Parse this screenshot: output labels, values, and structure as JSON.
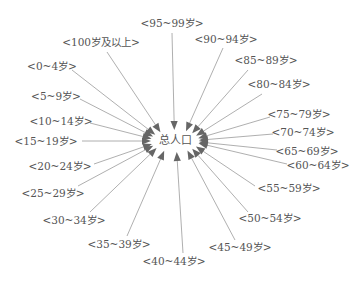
{
  "center": {
    "label": "总人口",
    "x": 175,
    "y": 141
  },
  "nodes": [
    {
      "label": "<95~99岁>",
      "x": 172,
      "y": 24,
      "ax": 172,
      "ay": 33
    },
    {
      "label": "<100岁及以上>",
      "x": 101,
      "y": 43,
      "ax": 107,
      "ay": 52
    },
    {
      "label": "<90~94岁>",
      "x": 226,
      "y": 40,
      "ax": 223,
      "ay": 48
    },
    {
      "label": "<0~4岁>",
      "x": 52,
      "y": 67,
      "ax": 72,
      "ay": 70
    },
    {
      "label": "<85~89岁>",
      "x": 266,
      "y": 61,
      "ax": 248,
      "ay": 70
    },
    {
      "label": "<80~84岁>",
      "x": 279,
      "y": 85,
      "ax": 262,
      "ay": 94
    },
    {
      "label": "<5~9岁>",
      "x": 56,
      "y": 97,
      "ax": 80,
      "ay": 99
    },
    {
      "label": "<75~79岁>",
      "x": 299,
      "y": 115,
      "ax": 270,
      "ay": 117
    },
    {
      "label": "<10~14岁>",
      "x": 61,
      "y": 122,
      "ax": 90,
      "ay": 123
    },
    {
      "label": "<70~74岁>",
      "x": 303,
      "y": 133,
      "ax": 273,
      "ay": 134
    },
    {
      "label": "<15~19岁>",
      "x": 46,
      "y": 142,
      "ax": 82,
      "ay": 141
    },
    {
      "label": "<65~69岁>",
      "x": 307,
      "y": 152,
      "ax": 277,
      "ay": 150
    },
    {
      "label": "<60~64岁>",
      "x": 318,
      "y": 166,
      "ax": 287,
      "ay": 164
    },
    {
      "label": "<20~24岁>",
      "x": 60,
      "y": 167,
      "ax": 94,
      "ay": 164
    },
    {
      "label": "<55~59岁>",
      "x": 289,
      "y": 189,
      "ax": 255,
      "ay": 186
    },
    {
      "label": "<25~29岁>",
      "x": 53,
      "y": 194,
      "ax": 78,
      "ay": 186
    },
    {
      "label": "<30~34岁>",
      "x": 74,
      "y": 221,
      "ax": 90,
      "ay": 212
    },
    {
      "label": "<50~54岁>",
      "x": 270,
      "y": 219,
      "ax": 248,
      "ay": 212
    },
    {
      "label": "<35~39岁>",
      "x": 119,
      "y": 245,
      "ax": 127,
      "ay": 236
    },
    {
      "label": "<45~49岁>",
      "x": 240,
      "y": 248,
      "ax": 235,
      "ay": 240
    },
    {
      "label": "<40~44岁>",
      "x": 174,
      "y": 262,
      "ax": 183,
      "ay": 253
    }
  ],
  "colors": {
    "line": "#9a9a9a",
    "arrow": "#666666",
    "text": "#555555",
    "background": "#ffffff"
  }
}
